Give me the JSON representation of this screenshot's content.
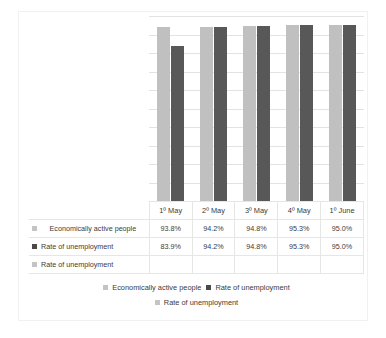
{
  "chart_data": {
    "type": "bar",
    "title": "",
    "subtitle": "",
    "xlabel": "",
    "ylabel": "",
    "categories": [
      "1º May",
      "2º May",
      "3º May",
      "4º May",
      "1º June"
    ],
    "series": [
      {
        "name": "Economically active people",
        "color": "#c0c0c0",
        "values": [
          93.8,
          94.2,
          94.8,
          95.3,
          95.0
        ],
        "labels": [
          "93.8%",
          "94.2%",
          "94.8%",
          "95.3%",
          "95.0%"
        ]
      },
      {
        "name": "Rate of unemployment",
        "color": "#585858",
        "values": [
          83.9,
          94.2,
          94.8,
          95.3,
          95.0
        ],
        "labels": [
          "83.9%",
          "94.2%",
          "94.8%",
          "95.3%",
          "95.0%"
        ]
      },
      {
        "name": "Rate of unemployment",
        "color": "#c0c0c0",
        "values": [
          null,
          null,
          null,
          null,
          null
        ],
        "labels": [
          "",
          "",
          "",
          "",
          ""
        ]
      }
    ],
    "ylim": [
      0,
      100
    ],
    "grid": true,
    "gridlines": [
      10,
      20,
      30,
      40,
      50,
      60,
      70,
      80,
      90,
      100
    ],
    "legend_position": "bottom",
    "data_table_visible": true,
    "axis_tick_labels_visible": false
  },
  "table": {
    "header_label": "",
    "categories": [
      "1º May",
      "2º May",
      "3º May",
      "4º May",
      "1º June"
    ],
    "rows": [
      {
        "marker": "legend-swatch-light",
        "label": "Economically active people",
        "values": [
          "93.8%",
          "94.2%",
          "94.8%",
          "95.3%",
          "95.0%"
        ]
      },
      {
        "marker": "legend-swatch-dark",
        "label": "Rate of unemployment",
        "values": [
          "83.9%",
          "94.2%",
          "94.8%",
          "95.3%",
          "95.0%"
        ]
      },
      {
        "marker": "legend-swatch-light",
        "label": "Rate of unemployment",
        "values": [
          "",
          "",
          "",
          "",
          ""
        ]
      }
    ]
  },
  "legend": {
    "row1": [
      {
        "marker": "legend-swatch-light",
        "label": "Economically active people"
      },
      {
        "marker": "legend-swatch-dark",
        "label": "Rate of unemployment"
      }
    ],
    "row2": [
      {
        "marker": "legend-swatch-light",
        "label": "Rate of unemployment"
      }
    ]
  },
  "colors": {
    "series_light": "#c0c0c0",
    "series_dark": "#585858",
    "gridline": "#e3e3e3",
    "table_border": "#e6e6e6",
    "frame_border": "#f1f1f1",
    "text": "#3b3b3b"
  }
}
